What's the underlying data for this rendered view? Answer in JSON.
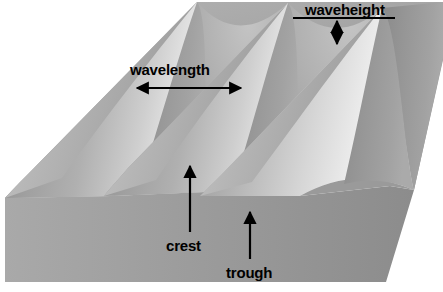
{
  "figure": {
    "background_color": "#ffffff"
  },
  "annotations": [
    {
      "id": "wavelength",
      "label": "wavelength",
      "measure_type": "horizontal-double-arrow",
      "description": "Distance from one crest to the next crest"
    },
    {
      "id": "waveheight",
      "label": "waveheight",
      "measure_type": "vertical-double-arrow",
      "description": "Vertical distance from trough to crest"
    },
    {
      "id": "crest",
      "label": "crest",
      "measure_type": "pointer-arrow-up",
      "description": "Highest point of the wave"
    },
    {
      "id": "trough",
      "label": "trough",
      "measure_type": "pointer-arrow-up",
      "description": "Lowest point between waves"
    }
  ],
  "colors": {
    "line": "#000000",
    "text": "#000000",
    "background": "#ffffff",
    "front_face_light": "#a8a8a8",
    "front_face_dark": "#8e8e8e",
    "wave_face_light": "#d2d2d2",
    "wave_face_mid": "#a4a4a4",
    "wave_face_dark": "#7c7c7c",
    "highlight": "#ededed",
    "shadow": "#6f6f6f"
  },
  "geometry": {
    "wave_count": 3,
    "crest_peaks_x": [
      197,
      288,
      382
    ],
    "wave_orientation": "diagonal lower-left to upper-right"
  }
}
